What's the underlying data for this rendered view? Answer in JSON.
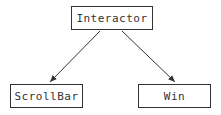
{
  "diagram": {
    "type": "class-hierarchy",
    "nodes": [
      {
        "id": "interactor",
        "label": "Interactor"
      },
      {
        "id": "scrollbar",
        "label": "ScrollBar"
      },
      {
        "id": "win",
        "label": "Win"
      }
    ],
    "edges": [
      {
        "from": "interactor",
        "to": "scrollbar",
        "style": "arrow"
      },
      {
        "from": "interactor",
        "to": "win",
        "style": "arrow"
      }
    ],
    "colors": {
      "stroke": "#333333",
      "background": "#ffffff"
    }
  }
}
